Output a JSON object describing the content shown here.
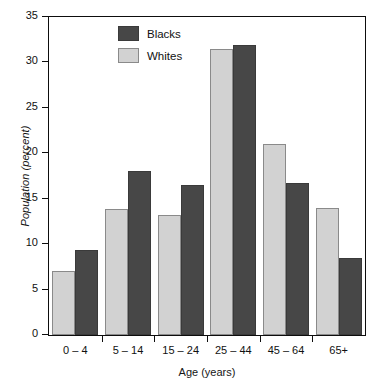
{
  "chart_data": {
    "type": "bar",
    "title": "",
    "xlabel": "Age (years)",
    "ylabel": "Population (percent)",
    "categories": [
      "0 – 4",
      "5 – 14",
      "15 – 24",
      "25 – 44",
      "45 – 64",
      "65+"
    ],
    "series": [
      {
        "name": "Whites",
        "color": "#d2d2d2",
        "values": [
          7.0,
          13.9,
          13.2,
          31.5,
          21.0,
          14.0
        ]
      },
      {
        "name": "Blacks",
        "color": "#474747",
        "values": [
          9.4,
          18.0,
          16.5,
          31.9,
          16.7,
          8.5
        ]
      }
    ],
    "ylim": [
      0,
      35
    ],
    "yticks": [
      0,
      5,
      10,
      15,
      20,
      25,
      30,
      35
    ],
    "ytick_labels": [
      "0",
      "5",
      "10",
      "15",
      "20",
      "25",
      "30",
      "35"
    ],
    "grid": false,
    "legend_position": "upper-left-inside",
    "legend_order": [
      "Blacks",
      "Whites"
    ],
    "frame": "full-box",
    "bar_order_in_group": [
      "Whites",
      "Blacks"
    ]
  },
  "axes": {
    "y_title": "Population (percent)",
    "x_title": "Age (years)"
  },
  "legend": {
    "entries": [
      {
        "label": "Blacks",
        "swatch": "dark-gray-swatch"
      },
      {
        "label": "Whites",
        "swatch": "light-gray-swatch"
      }
    ]
  }
}
